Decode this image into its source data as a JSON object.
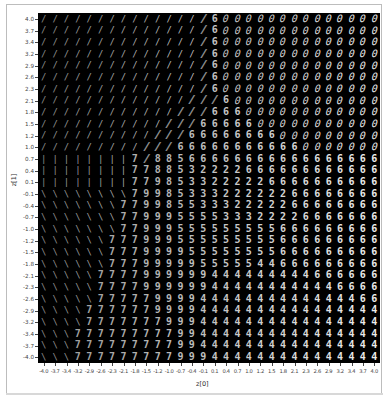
{
  "chart_data": {
    "type": "heatmap",
    "title": "",
    "xlabel": "z[0]",
    "ylabel": "z[1]",
    "xlim": [
      -4.0,
      4.0
    ],
    "ylim": [
      -4.0,
      4.0
    ],
    "grid": false,
    "x_ticks": [
      "-4.0",
      "-3.7",
      "-3.4",
      "-3.2",
      "-2.9",
      "-2.6",
      "-2.3",
      "-2.1",
      "-1.8",
      "-1.5",
      "-1.2",
      "-1.0",
      "-0.7",
      "-0.4",
      "-0.1",
      "0.1",
      "0.4",
      "0.7",
      "1.0",
      "1.2",
      "1.5",
      "1.8",
      "2.1",
      "2.3",
      "2.6",
      "2.9",
      "3.2",
      "3.4",
      "3.7",
      "4.0"
    ],
    "y_ticks": [
      "4.0",
      "3.7",
      "3.4",
      "3.2",
      "2.9",
      "2.6",
      "2.3",
      "2.1",
      "1.8",
      "1.5",
      "1.2",
      "1.0",
      "0.7",
      "0.4",
      "0.1",
      "-0.1",
      "-0.4",
      "-0.7",
      "-1.0",
      "-1.2",
      "-1.5",
      "-1.8",
      "-2.1",
      "-2.3",
      "-2.6",
      "-2.9",
      "-3.2",
      "-3.4",
      "-3.7",
      "-4.0"
    ],
    "digit_grid": [
      "//////////////~.000000000000000",
      "//////////////~.000000000000000",
      "//////////////~.000000000000000",
      "//////////////~.000000000000000",
      "//////////////~.000000000000000",
      "//////////////~.000000000000000",
      "//////////////~.000000000000000",
      "/////////////~~~600000000000000",
      "////////////~~~6660000000000000",
      "///////////~~~66666000000000000",
      "//////////~~~666666660000000000",
      "/////////~~~6666666666600000000",
      "||||||||7~8856666666666666666666",
      "||||||||778853222266666666666666",
      "||||||||779853322222666666666666",
      "\\\\\\\\\\\\\\\\79985333222222666666666",
      "\\\\\\\\\\\\\\77998553332222266666666",
      "\\\\\\\\\\\\\\77999555533322226666666",
      "\\\\\\\\\\\\\\77999555555555666666666",
      "\\\\\\\\\\\\77799955555555566666666",
      "\\\\\\\\\\\\77799995555555566666666",
      "\\\\\\\\\\\\77799999555554466666666",
      "\\\\\\\\\\777799999944444444466666",
      "\\\\\\\\\\777799999944444444444666",
      "\\\\\\\\\\777779999444444444444446",
      "\\\\\\\\7777779999444444444444444",
      "\\\\\\\\7777777999444444444444444",
      "\\\\\\777777777994444444444444444",
      "\\\\\\777777777994444444444444444",
      "\\\\\\777777777999444444444444444"
    ],
    "legend": []
  },
  "colors": {
    "background": "#000000",
    "digit": "#d0d0d0",
    "axis_text": "#444444",
    "frame": "#bdbdbd"
  }
}
